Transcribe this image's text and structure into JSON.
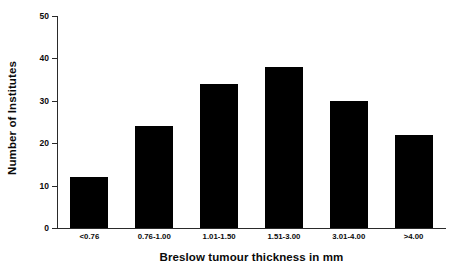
{
  "chart_data": {
    "type": "bar",
    "title": "",
    "categories": [
      "<0.76",
      "0.76-1.00",
      "1.01-1.50",
      "1.51-3.00",
      "3.01-4.00",
      ">4.00"
    ],
    "values": [
      12,
      24,
      34,
      38,
      30,
      22
    ],
    "xlabel": "Breslow tumour thickness in mm",
    "ylabel": "Number of Institutes",
    "ylim": [
      0,
      50
    ],
    "yticks": [
      0,
      10,
      20,
      30,
      40,
      50
    ],
    "ytick_labels": [
      "0",
      "10",
      "20",
      "30",
      "40",
      "50"
    ],
    "grid": false,
    "legend": null,
    "bar_color": "#000000",
    "axis_color": "#2a2a2a",
    "background": "#ffffff"
  }
}
